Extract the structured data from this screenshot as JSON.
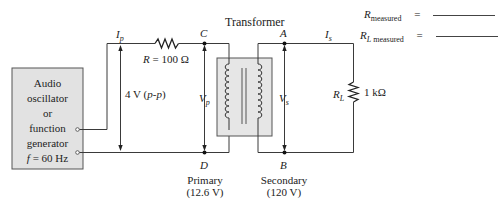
{
  "title": "Transformer",
  "generator": {
    "lines": [
      "Audio",
      "oscillator",
      "or",
      "function",
      "generator"
    ],
    "frequency_label": "f",
    "frequency_value": "=  60 Hz"
  },
  "primary_circuit": {
    "current_label": "I",
    "current_sub": "p",
    "resistor_label": "R",
    "resistor_value": "=  100 Ω",
    "source_voltage": "4 V (",
    "source_voltage_it": "p-p",
    "source_voltage_end": ")",
    "node_top": "C",
    "node_bottom": "D",
    "voltage_label": "V",
    "voltage_sub": "p",
    "winding_name": "Primary",
    "winding_rating": "(12.6 V)"
  },
  "secondary_circuit": {
    "current_label": "I",
    "current_sub": "s",
    "node_top": "A",
    "node_bottom": "B",
    "voltage_label": "V",
    "voltage_sub": "s",
    "load_label": "R",
    "load_sub": "L",
    "load_value": "1 kΩ",
    "winding_name": "Secondary",
    "winding_rating": "(120 V)"
  },
  "measurements": [
    {
      "symbol": "R",
      "sub_italic": "",
      "sub": "measured",
      "equals": "="
    },
    {
      "symbol": "R",
      "sub_italic": "L",
      "sub": "measured",
      "equals": "="
    }
  ],
  "colors": {
    "wire": "#3a3a3a",
    "generator_fill": "#e2e2e2",
    "transformer_fill": "#e6e6e6"
  }
}
